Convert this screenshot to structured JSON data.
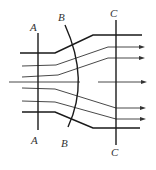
{
  "figure": {
    "width": 156,
    "height": 170
  },
  "colors": {
    "line": "#1a1a1a",
    "stream": "#333333",
    "label": "#333333",
    "background": "#ffffff"
  },
  "sections": [
    {
      "id": "A",
      "type": "line",
      "top_label": "A",
      "bottom_label": "A",
      "path": "M38,33 L38,130",
      "top_label_pos": [
        30,
        31
      ],
      "bottom_label_pos": [
        31,
        144
      ]
    },
    {
      "id": "B",
      "type": "arc",
      "top_label": "B",
      "bottom_label": "B",
      "path": "M65,25 Q90,80 68,127",
      "top_label_pos": [
        58,
        21
      ],
      "bottom_label_pos": [
        61,
        147
      ]
    },
    {
      "id": "C",
      "type": "line",
      "top_label": "C",
      "bottom_label": "C",
      "path": "M116,20 L116,145",
      "top_label_pos": [
        110,
        17
      ],
      "bottom_label_pos": [
        111,
        156
      ]
    }
  ],
  "walls": [
    {
      "name": "upper-wall",
      "path": "M20,53 L55,53 L93,35 L142,35"
    },
    {
      "name": "lower-wall",
      "path": "M22,112 L55,112 L93,128 L140,128"
    }
  ],
  "streamlines": [
    {
      "name": "streamline-1",
      "path": "M22,66 L56,65 L108,47 L140,47",
      "arrow_tip": [
        145,
        47
      ]
    },
    {
      "name": "streamline-2",
      "path": "M22,77 L58,75 L108,58 L140,58",
      "arrow_tip": [
        145,
        58
      ]
    },
    {
      "name": "streamline-center-in",
      "path": "M9,82 L80,82",
      "arrow_tip": null
    },
    {
      "name": "streamline-center-out",
      "path": "M98,82 L141,82",
      "arrow_tip": [
        147,
        82
      ]
    },
    {
      "name": "streamline-3",
      "path": "M22,88 L55,89 L116,108 L141,108",
      "arrow_tip": [
        146,
        108
      ]
    },
    {
      "name": "streamline-4",
      "path": "M22,101 L55,102 L116,119 L141,119",
      "arrow_tip": [
        146,
        119
      ]
    }
  ],
  "labels": {
    "A_top": "A",
    "A_bottom": "A",
    "B_top": "B",
    "B_bottom": "B",
    "C_top": "C",
    "C_bottom": "C"
  }
}
